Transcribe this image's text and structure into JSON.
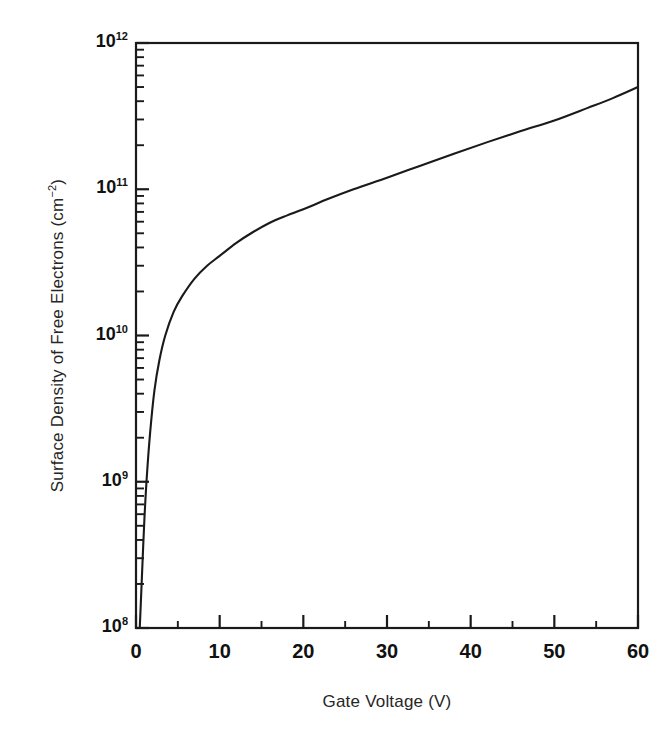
{
  "figure": {
    "background_color": "#ffffff",
    "line_color": "#1a1a1a",
    "axis_color": "#1a1a1a"
  },
  "axes": {
    "x_title": "Gate Voltage (V)",
    "y_title_main": "Surface Density of Free Electrons (cm",
    "y_title_sup": "−2",
    "y_title_tail": ")",
    "y_title_full": "Surface Density of Free Electrons (cm−2)"
  },
  "x_ticks": [
    {
      "value": 0,
      "label": "0"
    },
    {
      "value": 10,
      "label": "10"
    },
    {
      "value": 20,
      "label": "20"
    },
    {
      "value": 30,
      "label": "30"
    },
    {
      "value": 40,
      "label": "40"
    },
    {
      "value": 50,
      "label": "50"
    },
    {
      "value": 60,
      "label": "60"
    }
  ],
  "x_minor_ticks": [
    5,
    15,
    25,
    35,
    45,
    55
  ],
  "y_ticks": [
    {
      "value": 1000000000000.0,
      "mantissa": "10",
      "exponent": "12"
    },
    {
      "value": 100000000000.0,
      "mantissa": "10",
      "exponent": "11"
    },
    {
      "value": 10000000000.0,
      "mantissa": "10",
      "exponent": "10"
    },
    {
      "value": 1000000000.0,
      "mantissa": "10",
      "exponent": "9"
    },
    {
      "value": 100000000.0,
      "mantissa": "10",
      "exponent": "8"
    }
  ],
  "chart_data": {
    "type": "line",
    "title": "",
    "xlabel": "Gate Voltage (V)",
    "ylabel": "Surface Density of Free Electrons (cm−2)",
    "xlim": [
      0,
      60
    ],
    "ylim": [
      100000000,
      1000000000000
    ],
    "yscale": "log",
    "xscale": "linear",
    "grid": false,
    "legend": "none",
    "series": [
      {
        "name": "Surface density of free electrons",
        "x": [
          0.45,
          0.6,
          0.8,
          1.0,
          1.3,
          1.7,
          2.2,
          2.8,
          3.5,
          4.5,
          5.5,
          7.0,
          8.5,
          10.0,
          12.0,
          14.0,
          16.0,
          18.0,
          20.0,
          23.0,
          26.0,
          30.0,
          34.0,
          38.0,
          42.0,
          46.0,
          50.0,
          54.0,
          57.0,
          60.0
        ],
        "y": [
          100000000,
          160000000,
          300000000,
          550000000.0,
          1100000000.0,
          2200000000.0,
          4200000000.0,
          6800000000.0,
          10000000000.0,
          14500000000.0,
          18500000000.0,
          24500000000.0,
          30000000000.0,
          35000000000.0,
          43000000000.0,
          51000000000.0,
          59000000000.0,
          66000000000.0,
          73000000000.0,
          86000000000.0,
          100000000000.0,
          120000000000.0,
          145000000000.0,
          175000000000.0,
          210000000000.0,
          250000000000.0,
          295000000000.0,
          360000000000.0,
          420000000000.0,
          500000000000.0
        ]
      }
    ]
  }
}
